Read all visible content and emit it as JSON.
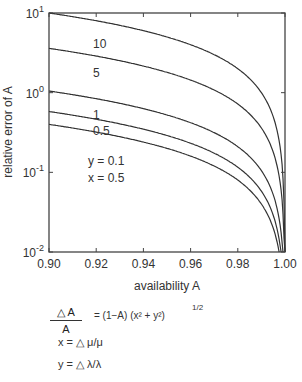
{
  "chart_data": {
    "type": "line",
    "title": "",
    "xlabel": "availability A",
    "ylabel": "relative error of A",
    "xlim": [
      0.9,
      1.0
    ],
    "ylim": [
      0.01,
      10
    ],
    "yscale": "log",
    "grid": false,
    "x_ticks": [
      "0.90",
      "0.92",
      "0.94",
      "0.96",
      "0.98",
      "1.00"
    ],
    "y_ticks": [
      {
        "base": "10",
        "exp": "1",
        "value": 10
      },
      {
        "base": "10",
        "exp": "0",
        "value": 1
      },
      {
        "base": "10",
        "exp": "-1",
        "value": 0.1
      },
      {
        "base": "10",
        "exp": "-2",
        "value": 0.01
      }
    ],
    "x": [
      0.9,
      0.92,
      0.94,
      0.96,
      0.98,
      0.99,
      0.995,
      0.999
    ],
    "series": [
      {
        "name": "10",
        "values": [
          1.0,
          0.8,
          0.6,
          0.4,
          0.2,
          0.1,
          0.05,
          0.01
        ],
        "scale": 10
      },
      {
        "name": "5",
        "values": [
          0.5,
          0.4,
          0.3,
          0.2,
          0.1,
          0.05,
          0.025,
          0.005
        ],
        "scale": 5
      },
      {
        "name": "1",
        "values": [
          0.11,
          0.088,
          0.066,
          0.044,
          0.022,
          0.011,
          0.0055,
          0.0011
        ]
      },
      {
        "name": "0.5",
        "values": [
          0.06,
          0.048,
          0.036,
          0.024,
          0.012,
          0.006,
          0.003,
          0.0006
        ]
      },
      {
        "name": "",
        "values": [
          0.04,
          0.032,
          0.024,
          0.016,
          0.008,
          0.004,
          0.002,
          0.0004
        ]
      }
    ],
    "curve_labels": [
      "10",
      "5",
      "1",
      "0.5"
    ],
    "annotations": [
      "y = 0.1",
      "x = 0.5"
    ],
    "legend_position": "none"
  },
  "formula": {
    "numerator": "△ A",
    "denominator": "A",
    "rhs": "= (1−A) (x² + y²)",
    "exponent": "1/2",
    "x_def": "x =  △ μ/μ",
    "y_def": "y =  △ λ/λ"
  }
}
